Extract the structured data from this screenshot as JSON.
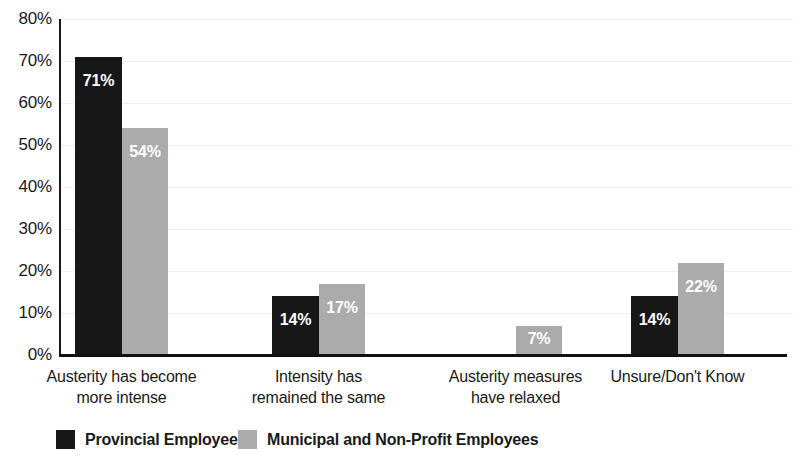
{
  "chart_data": {
    "type": "bar",
    "title": "",
    "subtitle": "",
    "xlabel": "",
    "ylabel": "",
    "ylim": [
      0,
      80
    ],
    "y_tick_labels": [
      "80%",
      "70%",
      "60%",
      "50%",
      "40%",
      "30%",
      "20%",
      "10%",
      "0%"
    ],
    "y_tick_values": [
      80,
      70,
      60,
      50,
      40,
      30,
      20,
      10,
      0
    ],
    "grid": true,
    "grid_axis": "y",
    "legend_position": "bottom",
    "categories": [
      "Austerity has become more intense",
      "Intensity has remained the same",
      "Austerity measures have relaxed",
      "Unsure/Don't Know"
    ],
    "category_lines": [
      [
        "Austerity has become",
        "more intense"
      ],
      [
        "Intensity has",
        "remained the same"
      ],
      [
        "Austerity measures",
        "have relaxed"
      ],
      [
        "Unsure/Don't Know"
      ]
    ],
    "series": [
      {
        "name": "Provincial Employees",
        "color": "#171717",
        "values": [
          71,
          14,
          0,
          14
        ],
        "labels": [
          "71%",
          "14%",
          "",
          "14%"
        ]
      },
      {
        "name": "Municipal and Non-Profit Employees",
        "color": "#ababab",
        "values": [
          54,
          17,
          7,
          22
        ],
        "labels": [
          "54%",
          "17%",
          "7%",
          "22%"
        ]
      }
    ]
  },
  "legend": {
    "items": [
      {
        "label": "Provincial Employees",
        "swatch": "dark"
      },
      {
        "label": "Municipal and Non-Profit Employees",
        "swatch": "light"
      }
    ]
  }
}
